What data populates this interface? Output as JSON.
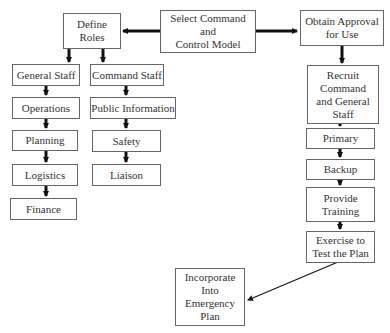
{
  "diagram": {
    "nodes": {
      "define_roles": "Define\nRoles",
      "select_model": "Select Command and\nControl Model",
      "obtain_approval": "Obtain Approval\nfor Use",
      "general_staff": "General Staff",
      "command_staff": "Command Staff",
      "operations": "Operations",
      "public_information": "Public Information",
      "planning": "Planning",
      "safety": "Safety",
      "logistics": "Logistics",
      "liaison": "Liaison",
      "finance": "Finance",
      "recruit": "Recruit\nCommand\nand General\nStaff",
      "primary": "Primary",
      "backup": "Backup",
      "provide_training": "Provide\nTraining",
      "exercise": "Exercise to\nTest the Plan",
      "incorporate": "Incorporate\nInto\nEmergency\nPlan"
    },
    "edges": [
      [
        "select_model",
        "define_roles"
      ],
      [
        "select_model",
        "obtain_approval"
      ],
      [
        "define_roles",
        "general_staff"
      ],
      [
        "define_roles",
        "command_staff"
      ],
      [
        "general_staff",
        "operations"
      ],
      [
        "operations",
        "planning"
      ],
      [
        "planning",
        "logistics"
      ],
      [
        "logistics",
        "finance"
      ],
      [
        "command_staff",
        "public_information"
      ],
      [
        "public_information",
        "safety"
      ],
      [
        "safety",
        "liaison"
      ],
      [
        "obtain_approval",
        "recruit"
      ],
      [
        "recruit",
        "primary"
      ],
      [
        "primary",
        "backup"
      ],
      [
        "backup",
        "provide_training"
      ],
      [
        "provide_training",
        "exercise"
      ],
      [
        "exercise",
        "incorporate"
      ]
    ]
  }
}
